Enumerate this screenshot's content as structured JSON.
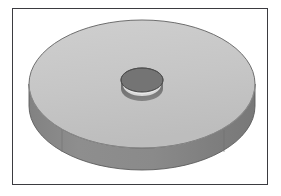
{
  "figure": {
    "title": "Isometric solid render of a flat circular washer",
    "subject_name": "flat-washer-disc",
    "caption": "",
    "background_color": "#ffffff",
    "canvas": {
      "width": 281,
      "height": 196
    }
  },
  "frame": {
    "name": "image-border",
    "stroke_color": "#3b3b40",
    "stroke_width": 1.6,
    "fill_color": "#ffffff",
    "x": 12,
    "y": 8,
    "width": 256,
    "height": 177
  },
  "object": {
    "type": "washer",
    "shading_model": "flat-faceted",
    "top_face": {
      "name": "disc-top-face",
      "fill_color": "#c6c6c6",
      "stroke_color": "#6e6e6e",
      "center_x": 142,
      "center_y": 84,
      "radius_x": 113,
      "radius_y": 64
    },
    "side_wall": {
      "name": "disc-side-wall",
      "fill_color": "#8c8c8c",
      "fill_color_dark": "#7d7d7d",
      "stroke_color": "#5c5c5c",
      "thickness_px": 22
    },
    "bore_hole": {
      "name": "center-bore-hole",
      "wall_fill_color": "#737373",
      "bottom_highlight_color": "#d8d8d8",
      "stroke_color": "#4e4e4e",
      "center_x": 142,
      "center_y": 80,
      "radius_x": 21,
      "radius_y": 12,
      "depth_px": 11
    },
    "facet_seams": {
      "name": "tessellation-seams",
      "stroke_color": "#6f6f6f",
      "count": 2
    }
  }
}
